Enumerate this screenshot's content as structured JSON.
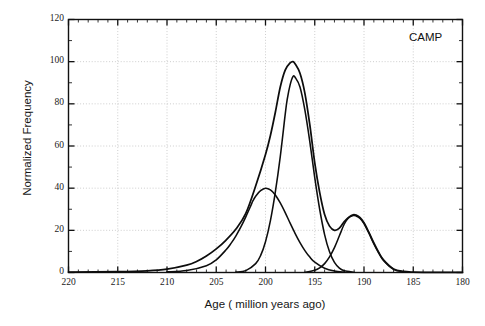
{
  "figure": {
    "annotation": "CAMP",
    "top_caption": "",
    "bottom_caption": ""
  },
  "chart_data": {
    "type": "line",
    "title": "",
    "xlabel": "Age ( million years ago)",
    "ylabel": "Normalized Frequency",
    "xlim": [
      220,
      180
    ],
    "ylim": [
      0,
      120
    ],
    "x_reversed": true,
    "grid": "dotted major gridlines on both axes",
    "legend": "none",
    "annotations": [
      {
        "text": "CAMP",
        "x": 182.5,
        "y": 110
      }
    ],
    "xticks": [
      220,
      215,
      210,
      205,
      200,
      195,
      190,
      185,
      180
    ],
    "xtick_labels": [
      "220",
      "215",
      "210",
      "205",
      "200",
      "195",
      "190",
      "185",
      "180"
    ],
    "x_minor_tick_interval": 1,
    "yticks": [
      0,
      20,
      40,
      60,
      80,
      100,
      120
    ],
    "ytick_labels": [
      "0",
      "20",
      "40",
      "60",
      "80",
      "100",
      "120"
    ],
    "y_minor_tick_interval": 10,
    "series": [
      {
        "name": "Gaussian component 1",
        "peak_age": 201.3,
        "peak_value": 40,
        "sigma": 2.0,
        "x": [
          210,
          208,
          206,
          205,
          204,
          203.5,
          203,
          202.5,
          202,
          201.5,
          201.3,
          201,
          200.5,
          200,
          199.5,
          199,
          198.5,
          198,
          197.5,
          197,
          196.5,
          196,
          195.5,
          195,
          194,
          193,
          192
        ],
        "values": [
          0.3,
          0.9,
          3.2,
          6.0,
          10.8,
          13.8,
          17.4,
          21.6,
          26.4,
          31.6,
          33.8,
          36.2,
          38.8,
          40.0,
          39.2,
          36.8,
          33.0,
          28.4,
          23.4,
          18.6,
          14.2,
          10.4,
          7.3,
          4.9,
          2.0,
          0.7,
          0.2
        ]
      },
      {
        "name": "Gaussian component 2",
        "peak_age": 197.2,
        "peak_value": 93,
        "sigma": 1.55,
        "x": [
          203,
          202,
          201,
          200.5,
          200,
          199.5,
          199,
          198.5,
          198,
          197.8,
          197.5,
          197.2,
          197,
          196.5,
          196,
          195.5,
          195,
          194.5,
          194,
          193.5,
          193,
          192.5,
          192,
          191
        ],
        "values": [
          0.2,
          0.9,
          4.2,
          8.0,
          14.6,
          24.6,
          38.2,
          55.0,
          75.0,
          82.0,
          89.0,
          93.0,
          92.6,
          88.0,
          77.0,
          62.0,
          45.0,
          30.0,
          18.0,
          9.8,
          4.8,
          2.1,
          0.8,
          0.1
        ]
      },
      {
        "name": "Gaussian component 3",
        "peak_age": 191.1,
        "peak_value": 27,
        "sigma": 1.4,
        "x": [
          196,
          195,
          194.5,
          194,
          193.5,
          193,
          192.5,
          192,
          191.6,
          191.1,
          190.8,
          190.4,
          190,
          189.5,
          189,
          188.5,
          188,
          187,
          186
        ],
        "values": [
          0.1,
          1.1,
          2.2,
          4.2,
          7.4,
          11.8,
          17.4,
          23.0,
          25.8,
          27.0,
          26.8,
          25.6,
          23.2,
          18.6,
          13.6,
          9.2,
          5.6,
          1.5,
          0.3
        ]
      },
      {
        "name": "Summed distribution",
        "peak_age": 197.2,
        "peak_value": 100,
        "x": [
          220,
          215,
          212,
          210,
          208,
          207,
          206,
          205,
          204,
          203,
          202,
          201,
          200,
          199.5,
          199,
          198.5,
          198,
          197.5,
          197.2,
          197,
          196.5,
          196,
          195.5,
          195,
          194.5,
          194,
          193.5,
          193,
          192.5,
          192,
          191.5,
          191.1,
          190.8,
          190.4,
          190,
          189.5,
          189,
          188.5,
          188,
          187,
          186,
          185,
          183,
          181,
          180
        ],
        "values": [
          0.2,
          0.4,
          0.8,
          1.6,
          3.5,
          5.2,
          7.8,
          11.2,
          15.4,
          20.6,
          28.0,
          41.0,
          56.0,
          65.0,
          76.0,
          88.0,
          96.0,
          99.4,
          100.0,
          99.0,
          94.5,
          85.0,
          70.0,
          52.0,
          38.0,
          27.5,
          22.0,
          20.0,
          21.0,
          24.2,
          26.4,
          27.4,
          27.2,
          26.0,
          23.6,
          19.0,
          14.0,
          9.5,
          5.9,
          1.7,
          0.5,
          0.2,
          0.1,
          0.05,
          0.05
        ]
      }
    ]
  }
}
